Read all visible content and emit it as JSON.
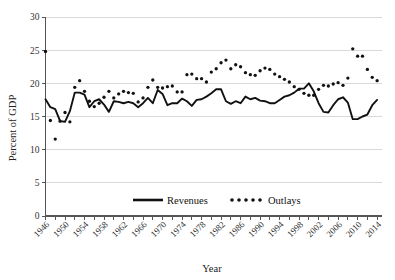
{
  "chart_data": {
    "type": "line",
    "title": "",
    "xlabel": "Year",
    "ylabel": "Percent of GDP",
    "xlim": [
      1946,
      2015
    ],
    "ylim": [
      0,
      30
    ],
    "yticks": [
      0,
      5,
      10,
      15,
      20,
      25,
      30
    ],
    "xticks": [
      1946,
      1950,
      1954,
      1958,
      1962,
      1966,
      1970,
      1974,
      1978,
      1982,
      1986,
      1990,
      1994,
      1998,
      2002,
      2006,
      2010,
      2014
    ],
    "grid": true,
    "legend_position": "bottom-center",
    "x": [
      1946,
      1947,
      1948,
      1949,
      1950,
      1951,
      1952,
      1953,
      1954,
      1955,
      1956,
      1957,
      1958,
      1959,
      1960,
      1961,
      1962,
      1963,
      1964,
      1965,
      1966,
      1967,
      1968,
      1969,
      1970,
      1971,
      1972,
      1973,
      1974,
      1975,
      1976,
      1977,
      1978,
      1979,
      1980,
      1981,
      1982,
      1983,
      1984,
      1985,
      1986,
      1987,
      1988,
      1989,
      1990,
      1991,
      1992,
      1993,
      1994,
      1995,
      1996,
      1997,
      1998,
      1999,
      2000,
      2001,
      2002,
      2003,
      2004,
      2005,
      2006,
      2007,
      2008,
      2009,
      2010,
      2011,
      2012,
      2013,
      2014
    ],
    "series": [
      {
        "name": "Revenues",
        "style": "solid-line",
        "color": "#111111",
        "values": [
          17.6,
          16.4,
          16.1,
          14.3,
          14.2,
          15.8,
          18.6,
          18.6,
          18.3,
          16.4,
          17.3,
          17.6,
          16.8,
          15.7,
          17.3,
          17.2,
          17.0,
          17.2,
          17.0,
          16.4,
          17.0,
          17.8,
          17.0,
          19.0,
          18.4,
          16.7,
          17.0,
          17.0,
          17.7,
          17.3,
          16.6,
          17.5,
          17.6,
          18.0,
          18.5,
          19.1,
          19.1,
          17.3,
          16.9,
          17.3,
          17.0,
          18.0,
          17.6,
          17.8,
          17.4,
          17.3,
          17.0,
          17.0,
          17.5,
          18.0,
          18.2,
          18.6,
          19.2,
          19.2,
          20.0,
          18.8,
          17.0,
          15.7,
          15.6,
          16.7,
          17.6,
          17.9,
          17.1,
          14.6,
          14.6,
          15.0,
          15.3,
          16.7,
          17.5
        ]
      },
      {
        "name": "Outlays",
        "style": "dotted",
        "color": "#111111",
        "values": [
          24.8,
          14.4,
          11.6,
          14.3,
          15.6,
          14.2,
          19.4,
          20.4,
          18.8,
          17.3,
          16.5,
          17.0,
          17.9,
          18.8,
          17.8,
          18.4,
          18.8,
          18.6,
          18.5,
          17.2,
          17.8,
          19.4,
          20.5,
          19.4,
          19.3,
          19.5,
          19.6,
          18.7,
          18.7,
          21.3,
          21.4,
          20.7,
          20.7,
          20.2,
          21.7,
          22.2,
          23.1,
          23.5,
          22.2,
          22.8,
          22.5,
          21.6,
          21.3,
          21.2,
          21.9,
          22.3,
          22.1,
          21.4,
          21.0,
          20.6,
          20.2,
          19.5,
          19.1,
          18.5,
          18.2,
          18.2,
          19.1,
          19.7,
          19.6,
          19.9,
          20.1,
          19.7,
          20.8,
          25.2,
          24.1,
          24.1,
          22.1,
          20.9,
          20.4
        ]
      }
    ]
  },
  "legend": {
    "items": [
      {
        "label": "Revenues",
        "marker": "line"
      },
      {
        "label": "Outlays",
        "marker": "dots"
      }
    ]
  },
  "axes": {
    "y_title": "Percent of GDP",
    "x_title": "Year"
  }
}
